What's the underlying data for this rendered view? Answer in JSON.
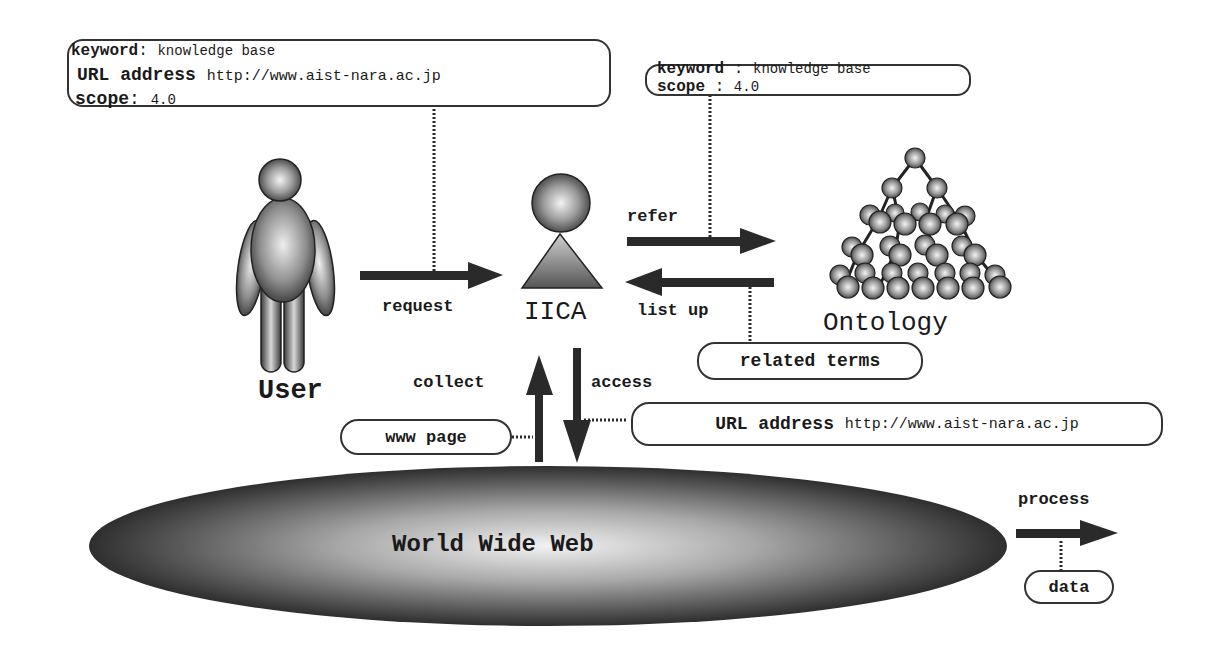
{
  "request_box": {
    "keyword_label": "keyword",
    "keyword_sep": ":",
    "keyword_value": "knowledge base",
    "url_label": "URL address",
    "url_value": "http://www.aist-nara.ac.jp",
    "scope_label": "scope",
    "scope_sep": ":",
    "scope_value": "4.0"
  },
  "refer_box": {
    "keyword_label": "keyword",
    "keyword_sep": ":",
    "keyword_value": "knowledge base",
    "scope_label": "scope",
    "scope_sep": ":",
    "scope_value": "4.0"
  },
  "nodes": {
    "user": "User",
    "agent": "IICA",
    "ontology": "Ontology",
    "web": "World Wide Web"
  },
  "arrows": {
    "request": "request",
    "refer": "refer",
    "list_up": "list up",
    "collect": "collect",
    "access": "access"
  },
  "data_items": {
    "related_terms": "related terms",
    "www_page": "www page",
    "access_url_label": "URL address",
    "access_url_value": "http://www.aist-nara.ac.jp"
  },
  "legend": {
    "process_label": "process",
    "data_label": "data"
  },
  "colors": {
    "ink": "#1a1a1a",
    "arrow": "#2a2a2a",
    "sphere_light": "#ffffff",
    "sphere_dark": "#3a3a3a"
  }
}
